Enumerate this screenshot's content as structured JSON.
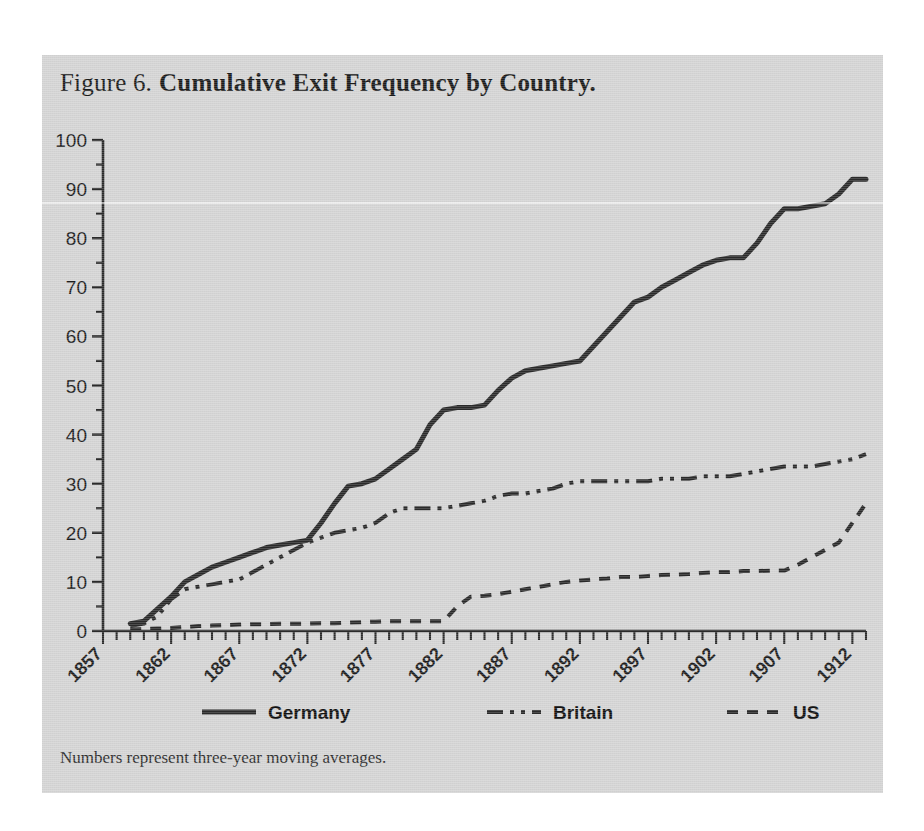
{
  "figure": {
    "label": "Figure 6.",
    "caption": "Cumulative Exit Frequency by Country.",
    "note": "Numbers represent three-year moving averages."
  },
  "axes": {
    "y_ticks": [
      "0",
      "10",
      "20",
      "30",
      "40",
      "50",
      "60",
      "70",
      "80",
      "90",
      "100"
    ],
    "x_ticks": [
      "1857",
      "1862",
      "1867",
      "1872",
      "1877",
      "1882",
      "1887",
      "1892",
      "1897",
      "1902",
      "1907",
      "1912"
    ]
  },
  "legend": {
    "items": [
      {
        "label": "Germany",
        "style": "solid"
      },
      {
        "label": "Britain",
        "style": "dash-dot-dot"
      },
      {
        "label": "US",
        "style": "dashed"
      }
    ]
  },
  "colors": {
    "panel_background": "#d4d4d4",
    "page_background": "#ffffff",
    "line": "#2a2a2a",
    "text": "#1a1a1a"
  },
  "chart_data": {
    "type": "line",
    "title": "Cumulative Exit Frequency by Country.",
    "xlabel": "",
    "ylabel": "",
    "xlim": [
      1857,
      1913
    ],
    "ylim": [
      0,
      100
    ],
    "grid": false,
    "legend_position": "bottom",
    "annotation": "Numbers represent three-year moving averages.",
    "x": [
      1857,
      1858,
      1859,
      1860,
      1861,
      1862,
      1863,
      1864,
      1865,
      1866,
      1867,
      1868,
      1869,
      1870,
      1871,
      1872,
      1873,
      1874,
      1875,
      1876,
      1877,
      1878,
      1879,
      1880,
      1881,
      1882,
      1883,
      1884,
      1885,
      1886,
      1887,
      1888,
      1889,
      1890,
      1891,
      1892,
      1893,
      1894,
      1895,
      1896,
      1897,
      1898,
      1899,
      1900,
      1901,
      1902,
      1903,
      1904,
      1905,
      1906,
      1907,
      1908,
      1909,
      1910,
      1911,
      1912,
      1913
    ],
    "series": [
      {
        "name": "Germany",
        "style": "solid",
        "values": [
          null,
          null,
          1.5,
          2.0,
          4.5,
          7.0,
          10.0,
          11.5,
          13.0,
          14.0,
          15.0,
          16.0,
          17.0,
          17.5,
          18.0,
          18.5,
          22.0,
          26.0,
          29.5,
          30.0,
          31.0,
          33.0,
          35.0,
          37.0,
          42.0,
          45.0,
          45.5,
          45.5,
          46.0,
          49.0,
          51.5,
          53.0,
          53.5,
          54.0,
          54.5,
          55.0,
          58.0,
          61.0,
          64.0,
          67.0,
          68.0,
          70.0,
          71.5,
          73.0,
          74.5,
          75.5,
          76.0,
          76.0,
          79.0,
          83.0,
          86.0,
          86.0,
          86.5,
          87.0,
          89.0,
          92.0,
          92.0
        ]
      },
      {
        "name": "Britain",
        "style": "dash-dot-dot",
        "values": [
          null,
          null,
          1.0,
          1.5,
          3.0,
          6.5,
          8.5,
          9.0,
          9.5,
          10.0,
          10.5,
          12.0,
          13.5,
          15.0,
          16.5,
          18.0,
          19.0,
          20.0,
          20.5,
          21.0,
          22.0,
          24.0,
          25.0,
          25.0,
          25.0,
          25.0,
          25.5,
          26.0,
          26.5,
          27.5,
          28.0,
          28.0,
          28.5,
          29.0,
          30.0,
          30.5,
          30.5,
          30.5,
          30.5,
          30.5,
          30.5,
          31.0,
          31.0,
          31.0,
          31.5,
          31.5,
          31.5,
          32.0,
          32.5,
          33.0,
          33.5,
          33.5,
          33.5,
          34.0,
          34.5,
          35.0,
          36.0
        ]
      },
      {
        "name": "US",
        "style": "dashed",
        "values": [
          null,
          null,
          0.3,
          0.4,
          0.5,
          0.6,
          0.8,
          1.0,
          1.1,
          1.2,
          1.3,
          1.4,
          1.4,
          1.5,
          1.5,
          1.5,
          1.6,
          1.6,
          1.7,
          1.8,
          1.9,
          2.0,
          2.0,
          2.0,
          2.0,
          2.0,
          5.0,
          7.0,
          7.2,
          7.5,
          8.0,
          8.5,
          9.0,
          9.5,
          10.0,
          10.3,
          10.5,
          10.7,
          11.0,
          11.0,
          11.2,
          11.4,
          11.5,
          11.6,
          11.8,
          12.0,
          12.0,
          12.2,
          12.2,
          12.3,
          12.3,
          13.5,
          15.0,
          16.5,
          18.0,
          22.0,
          26.0
        ]
      }
    ]
  }
}
